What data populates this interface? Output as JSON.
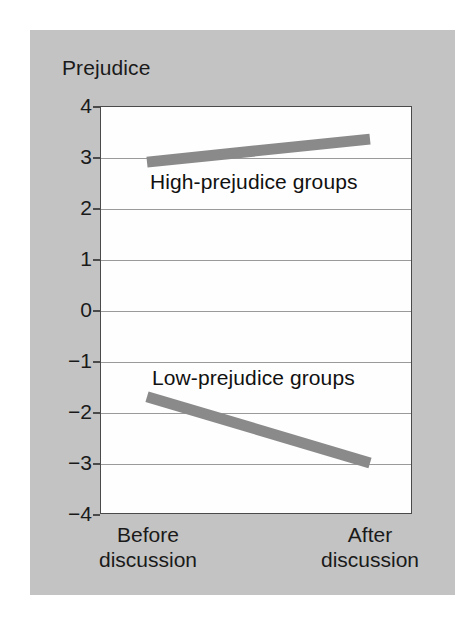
{
  "figure": {
    "panel_color": "#c3c3c3",
    "plot_background": "#fefefe",
    "line_color": "#8a8a8a",
    "axis_color": "#4a4a4a",
    "grid_color": "#9a9a9a",
    "text_color": "#1a1a1a"
  },
  "chart_data": {
    "type": "line",
    "title": "",
    "xlabel": "",
    "ylabel": "Prejudice",
    "categories": [
      "Before discussion",
      "After discussion"
    ],
    "x_tick_labels": [
      {
        "line1": "Before",
        "line2": "discussion"
      },
      {
        "line1": "After",
        "line2": "discussion"
      }
    ],
    "ylim": [
      -4,
      4
    ],
    "y_ticks": [
      4,
      3,
      2,
      1,
      0,
      -1,
      -2,
      -3,
      -4
    ],
    "y_tick_labels": [
      "4",
      "3",
      "2",
      "1",
      "0",
      "−1",
      "−2",
      "−3",
      "−4"
    ],
    "grid": true,
    "legend_position": "inline-annotations",
    "series": [
      {
        "name": "High-prejudice groups",
        "values": [
          2.9,
          3.35
        ],
        "color": "#8a8a8a",
        "annotation": "High-prejudice groups"
      },
      {
        "name": "Low-prejudice groups",
        "values": [
          -1.7,
          -3.0
        ],
        "color": "#8a8a8a",
        "annotation": "Low-prejudice groups"
      }
    ],
    "annotations": [
      {
        "text": "High-prejudice groups",
        "x": 0.5,
        "y": 2.45
      },
      {
        "text": "Low-prejudice groups",
        "x": 0.5,
        "y": -1.4
      }
    ]
  }
}
